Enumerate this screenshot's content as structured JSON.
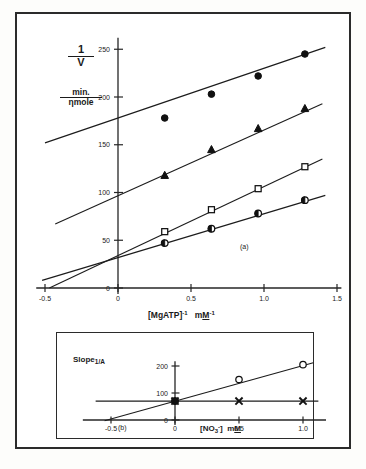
{
  "figure": {
    "panel_a_tag": "(a)",
    "panel_b_tag": "(b)"
  },
  "panel_a": {
    "y_axis_title_numerator": "1",
    "y_axis_title_denominator": "V",
    "y_units_numerator": "min.",
    "y_units_denominator": "ηmole",
    "x_axis_title": "[MgATP]",
    "x_axis_title_sup": "-1",
    "x_axis_units": "mM",
    "x_axis_units_sup": "-1",
    "x_ticks": [
      "-0.5",
      "0",
      "0.5",
      "1.0",
      "1.5"
    ],
    "y_ticks": [
      "0",
      "50",
      "100",
      "150",
      "200",
      "250"
    ]
  },
  "panel_b": {
    "y_axis_title": "Slope",
    "y_axis_title_sub": "1/A",
    "x_axis_title": "[NO",
    "x_axis_title_sub": "3",
    "x_axis_title_sup": "-",
    "x_axis_title_tail": "]",
    "x_axis_units": "mM",
    "x_ticks": [
      "-0.5",
      "0",
      "0.5",
      "1.0"
    ],
    "y_ticks": [
      "0",
      "100",
      "200"
    ]
  },
  "chart_data": [
    {
      "type": "line",
      "panel": "a",
      "title": "Lineweaver-Burk plot of 1/V versus [MgATP]-1",
      "xlabel": "[MgATP]-1  mM-1",
      "ylabel": "1/V  min./ηmole",
      "xlim": [
        -0.5,
        1.5
      ],
      "ylim": [
        0,
        260
      ],
      "grid": false,
      "legend": "none",
      "x": [
        0.32,
        0.64,
        0.96,
        1.28
      ],
      "series": [
        {
          "name": "filled-circle",
          "marker": "filled-circle",
          "values": [
            178,
            203,
            222,
            245
          ],
          "y_intercept": 152,
          "fit_x": [
            -0.5,
            1.42
          ],
          "fit_y": [
            152,
            252
          ]
        },
        {
          "name": "filled-triangle",
          "marker": "filled-triangle",
          "values": [
            118,
            145,
            167,
            188
          ],
          "y_intercept": 95,
          "fit_x": [
            -0.43,
            1.4
          ],
          "fit_y": [
            67,
            193
          ]
        },
        {
          "name": "open-square",
          "marker": "open-square",
          "values": [
            59,
            82,
            104,
            127
          ],
          "y_intercept": 33,
          "fit_x": [
            -0.47,
            1.4
          ],
          "fit_y": [
            0,
            135
          ]
        },
        {
          "name": "half-filled-circle",
          "marker": "half-filled-circle",
          "values": [
            47,
            62,
            78,
            92
          ],
          "y_intercept": 32,
          "fit_x": [
            -0.52,
            1.42
          ],
          "fit_y": [
            8,
            97
          ]
        }
      ]
    },
    {
      "type": "line",
      "panel": "b",
      "title": "Replot of slope versus [NO3-]",
      "xlabel": "[NO3-]  mM",
      "ylabel": "Slope 1/A",
      "xlim": [
        -0.6,
        1.15
      ],
      "ylim": [
        0,
        215
      ],
      "grid": false,
      "legend": "none",
      "series": [
        {
          "name": "open-circle",
          "marker": "open-circle",
          "x": [
            0.0,
            0.5,
            1.0
          ],
          "values": [
            70,
            150,
            205
          ],
          "x_intercept": -0.5,
          "fit_x": [
            -0.55,
            1.08
          ],
          "fit_y": [
            -3,
            212
          ]
        },
        {
          "name": "cross",
          "marker": "cross",
          "x": [
            0.0,
            0.5,
            1.0
          ],
          "values": [
            70,
            70,
            70
          ],
          "fit_x": [
            -0.62,
            1.12
          ],
          "fit_y": [
            70,
            70
          ]
        }
      ]
    }
  ]
}
